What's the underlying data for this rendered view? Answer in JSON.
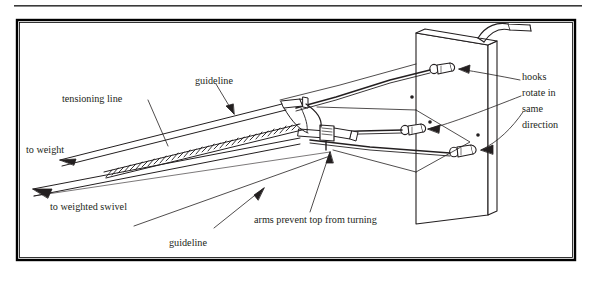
{
  "figure": {
    "type": "technical-line-diagram",
    "rule_top": true,
    "border": {
      "color": "#000000",
      "style": "solid-rectangle"
    },
    "background": "#ffffff",
    "ink": "#231f20"
  },
  "labels": {
    "tensioning_line": "tensioning line",
    "guideline_top": "guideline",
    "to_weight": "to weight",
    "to_weighted_swivel": "to weighted swivel",
    "guideline_bottom": "guideline",
    "arms_prevent": "arms prevent top from turning",
    "hooks_rotate": {
      "line1": "hooks",
      "line2": "rotate in",
      "line3": "same",
      "line4": "direction"
    }
  },
  "parts": {
    "panel": "vertical-panel",
    "crank": "crank-handle",
    "hooks": [
      {
        "name": "hook-upper"
      },
      {
        "name": "hook-middle"
      },
      {
        "name": "hook-lower"
      }
    ],
    "swivel_top": "swivel-top-assembly",
    "arms": "cross-arms",
    "rope": "twisted-tensioning-rope"
  }
}
